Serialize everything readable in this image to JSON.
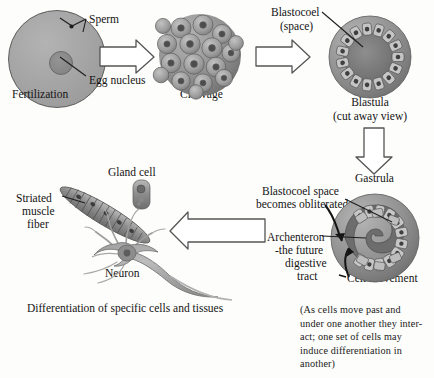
{
  "diagram": {
    "title_caption": "Differentiation of specific cells and tissues",
    "stages": [
      {
        "id": "fertilization",
        "label": "Fertilization"
      },
      {
        "id": "cleavage",
        "label": "Cleavage"
      },
      {
        "id": "blastula",
        "label": "Blastula",
        "sublabel": "(cut away view)"
      },
      {
        "id": "gastrula",
        "label": "Gastrula"
      }
    ],
    "labels": {
      "sperm": "Sperm",
      "egg_nucleus": "Egg nucleus",
      "blastocoel": "Blastocoel",
      "blastocoel_sub": "(space)",
      "blastocoel_obliterated_l1": "Blastocoel space",
      "blastocoel_obliterated_l2": "becomes obliterated",
      "archenteron_l1": "Archenteron",
      "archenteron_l2": "-the future",
      "archenteron_l3": "digestive",
      "archenteron_l4": "tract",
      "cell_movement": "Cell movement",
      "gland_cell": "Gland cell",
      "striated_l1": "Striated",
      "striated_l2": "muscle",
      "striated_l3": "fiber",
      "neuron": "Neuron"
    },
    "note": {
      "line1": "(As cells move past and",
      "line2": "under one another they inter-",
      "line3": "act; one set of cells may",
      "line4": "induce differentiation in",
      "line5": "another)"
    },
    "colors": {
      "ink": "#141414",
      "cell_gray": "#a3a3a3",
      "nucleus_gray": "#6f6f6f",
      "arrow_outline": "#4a4a4a",
      "background": "#fdfdfb"
    }
  }
}
